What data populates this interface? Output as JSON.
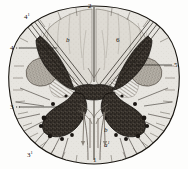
{
  "figure": {
    "name": "transverse-section-spinal-cord",
    "width": 188,
    "height": 169,
    "background_color": "#fdfdfc",
    "ink_color": "#15120f",
    "gray_matter_color": "#3a342e",
    "white_matter_color": "#e3e1dc",
    "column_fill_color": "#dcd9d2",
    "nucleus_fill_color": "#b5b0a7"
  },
  "labels": [
    {
      "id": "label-2",
      "text": "2",
      "sup": "",
      "x": 88,
      "y": 3,
      "italic": false
    },
    {
      "id": "label-4a",
      "text": "4",
      "sup": "1",
      "x": 25,
      "y": 14,
      "italic": false
    },
    {
      "id": "label-b",
      "text": "b",
      "sup": "",
      "x": 67,
      "y": 38,
      "italic": true
    },
    {
      "id": "label-6",
      "text": "6",
      "sup": "",
      "x": 117,
      "y": 38,
      "italic": false
    },
    {
      "id": "label-4",
      "text": "4",
      "sup": "",
      "x": 11,
      "y": 45,
      "italic": false
    },
    {
      "id": "label-5",
      "text": "5",
      "sup": "",
      "x": 174,
      "y": 62,
      "italic": false
    },
    {
      "id": "label-3",
      "text": "3",
      "sup": "",
      "x": 11,
      "y": 103,
      "italic": false
    },
    {
      "id": "label-b2",
      "text": "b",
      "sup": "",
      "x": 105,
      "y": 128,
      "italic": true
    },
    {
      "id": "label-a1",
      "text": "a",
      "sup": "1",
      "x": 105,
      "y": 142,
      "italic": true
    },
    {
      "id": "label-3a",
      "text": "3",
      "sup": "1",
      "x": 28,
      "y": 152,
      "italic": false
    },
    {
      "id": "label-1",
      "text": "1",
      "sup": "",
      "x": 93,
      "y": 157,
      "italic": false
    }
  ],
  "leader_lines": [
    {
      "name": "leader-4",
      "x1": 20,
      "y1": 48,
      "x2": 57,
      "y2": 48
    },
    {
      "name": "leader-3",
      "x1": 19,
      "y1": 107,
      "x2": 63,
      "y2": 107
    },
    {
      "name": "leader-5",
      "x1": 172,
      "y1": 65,
      "x2": 136,
      "y2": 65
    }
  ],
  "structures": [
    {
      "name": "outer-cord-outline",
      "description": "oval pial boundary of the section"
    },
    {
      "name": "posterior-median-fissure",
      "description": "midline cleft at top"
    },
    {
      "name": "anterior-median-fissure",
      "description": "midline cleft at bottom"
    },
    {
      "name": "posterior-column-left",
      "description": "left dorsal funiculus"
    },
    {
      "name": "posterior-column-right",
      "description": "right dorsal funiculus"
    },
    {
      "name": "gray-matter-dorsal-horns",
      "description": "dark speckled dorsal horns"
    },
    {
      "name": "gray-matter-ventral-horns",
      "description": "dark speckled ventral horns"
    },
    {
      "name": "lateral-nucleus-left",
      "description": "left stippled oval nucleus"
    },
    {
      "name": "lateral-nucleus-right",
      "description": "right stippled oval nucleus"
    },
    {
      "name": "central-commissure",
      "description": "dark band joining the horns"
    },
    {
      "name": "root-fibre-bundles",
      "description": "radiating rootlet fascicles"
    }
  ]
}
